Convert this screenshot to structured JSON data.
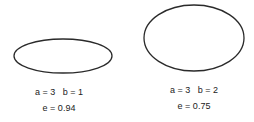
{
  "ellipses": [
    {
      "params_label": "a = 3   b = 1",
      "eccentricity_label": "e = 0.94",
      "a": 3,
      "b": 1,
      "e": 0.94,
      "shape": {
        "cx": 63,
        "cy": 56,
        "rx": 49,
        "ry": 17
      }
    },
    {
      "params_label": "a = 3   b = 2",
      "eccentricity_label": "e = 0.75",
      "a": 3,
      "b": 2,
      "e": 0.75,
      "shape": {
        "cx": 194,
        "cy": 38,
        "rx": 50,
        "ry": 33
      }
    }
  ],
  "stroke_color": "#2a2a2a"
}
